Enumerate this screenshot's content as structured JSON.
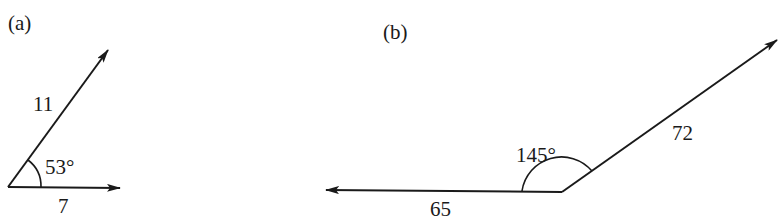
{
  "figures": [
    {
      "id": "a",
      "label": "(a)",
      "vectors": [
        {
          "magnitude_label": "11",
          "direction": "53° above horizontal"
        },
        {
          "magnitude_label": "7",
          "direction": "horizontal right"
        }
      ],
      "angle_label": "53°"
    },
    {
      "id": "b",
      "label": "(b)",
      "vectors": [
        {
          "magnitude_label": "72",
          "direction": "up-right"
        },
        {
          "magnitude_label": "65",
          "direction": "horizontal left"
        }
      ],
      "angle_label": "145°"
    }
  ],
  "colors": {
    "stroke": "#1a1a1a",
    "background": "#ffffff"
  }
}
